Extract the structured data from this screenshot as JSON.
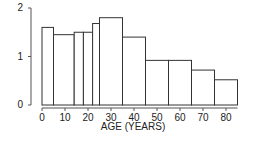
{
  "chart_data": {
    "type": "bar",
    "subtype": "histogram",
    "title": "",
    "xlabel": "AGE (YEARS)",
    "ylabel": "",
    "xlim": [
      0,
      85
    ],
    "ylim": [
      0,
      2
    ],
    "xticks": [
      0,
      10,
      20,
      30,
      40,
      50,
      60,
      70,
      80
    ],
    "yticks": [
      0,
      1,
      2
    ],
    "grid": false,
    "legend": null,
    "bins": [
      {
        "start": 0,
        "end": 5,
        "value": 1.6
      },
      {
        "start": 5,
        "end": 14,
        "value": 1.45
      },
      {
        "start": 14,
        "end": 18,
        "value": 1.5
      },
      {
        "start": 18,
        "end": 22,
        "value": 1.5
      },
      {
        "start": 22,
        "end": 25,
        "value": 1.68
      },
      {
        "start": 25,
        "end": 35,
        "value": 1.8
      },
      {
        "start": 35,
        "end": 45,
        "value": 1.4
      },
      {
        "start": 45,
        "end": 55,
        "value": 0.92
      },
      {
        "start": 55,
        "end": 65,
        "value": 0.92
      },
      {
        "start": 65,
        "end": 75,
        "value": 0.72
      },
      {
        "start": 75,
        "end": 85,
        "value": 0.52
      }
    ],
    "colors": {
      "bar_fill": "#ffffff",
      "bar_stroke": "#333333",
      "axis": "#555555"
    }
  }
}
